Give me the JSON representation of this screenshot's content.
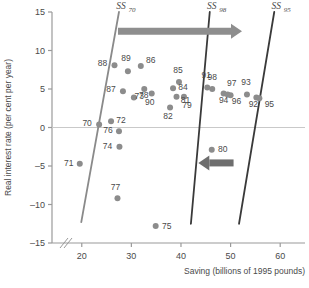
{
  "chart_data": {
    "type": "scatter",
    "title": "",
    "xlabel": "Saving (billions of 1995 pounds)",
    "ylabel": "Real interest rate (per cent per year)",
    "xlim": [
      14,
      65
    ],
    "ylim": [
      -15,
      15
    ],
    "xticks": [
      20,
      30,
      40,
      50,
      60
    ],
    "yticks": [
      15,
      10,
      5,
      0,
      -5,
      -10,
      -15
    ],
    "grid": false,
    "axis_break": true,
    "zero_line": true,
    "legend": "none",
    "points": [
      {
        "label": "88",
        "x": 26.6,
        "y": 8.1
      },
      {
        "label": "89",
        "x": 29.3,
        "y": 7.3
      },
      {
        "label": "86",
        "x": 31.9,
        "y": 8.0
      },
      {
        "label": "87",
        "x": 28.3,
        "y": 4.7
      },
      {
        "label": "78",
        "x": 30.5,
        "y": 3.9
      },
      {
        "label": "73",
        "x": 32.6,
        "y": 5.0
      },
      {
        "label": "90",
        "x": 34.1,
        "y": 4.4
      },
      {
        "label": "85",
        "x": 39.6,
        "y": 5.9
      },
      {
        "label": "84",
        "x": 38.4,
        "y": 5.1
      },
      {
        "label": "79",
        "x": 40.6,
        "y": 4.0
      },
      {
        "label": "81",
        "x": 39.1,
        "y": 4.0
      },
      {
        "label": "82",
        "x": 37.8,
        "y": 2.6
      },
      {
        "label": "91",
        "x": 45.3,
        "y": 5.2
      },
      {
        "label": "98",
        "x": 46.3,
        "y": 5.0
      },
      {
        "label": "97",
        "x": 48.6,
        "y": 4.4
      },
      {
        "label": "94",
        "x": 49.4,
        "y": 4.3
      },
      {
        "label": "96",
        "x": 50.0,
        "y": 4.2
      },
      {
        "label": "93",
        "x": 53.3,
        "y": 4.3
      },
      {
        "label": "92",
        "x": 55.2,
        "y": 3.9
      },
      {
        "label": "95",
        "x": 55.8,
        "y": 3.8
      },
      {
        "label": "72",
        "x": 25.9,
        "y": 0.8
      },
      {
        "label": "70",
        "x": 23.5,
        "y": 0.4
      },
      {
        "label": "76",
        "x": 27.5,
        "y": -0.5
      },
      {
        "label": "74",
        "x": 27.6,
        "y": -2.5
      },
      {
        "label": "71",
        "x": 19.6,
        "y": -4.7
      },
      {
        "label": "80",
        "x": 46.2,
        "y": -2.9
      },
      {
        "label": "77",
        "x": 27.2,
        "y": -9.2
      },
      {
        "label": "75",
        "x": 34.9,
        "y": -12.8
      }
    ],
    "lines": [
      {
        "name": "SS70",
        "base": "SS",
        "subscript": "70",
        "x_top": 27.5,
        "y_top": 15.0,
        "x_bottom": 19.9,
        "y_bottom": -12.3
      },
      {
        "name": "SS98",
        "base": "SS",
        "subscript": "98",
        "x_top": 45.8,
        "y_top": 15.0,
        "x_bottom": 42.0,
        "y_bottom": -12.5
      },
      {
        "name": "SS95",
        "base": "SS",
        "subscript": "95",
        "x_top": 58.8,
        "y_top": 15.0,
        "x_bottom": 51.7,
        "y_bottom": -12.5
      }
    ],
    "arrows": [
      {
        "name": "rightward-shift-arrow",
        "direction": "right",
        "x_start": 27.3,
        "x_end": 52.3,
        "y": 12.5,
        "color": "#8e8e8e"
      },
      {
        "name": "leftward-shift-arrow",
        "direction": "left",
        "x_start": 50.6,
        "x_end": 43.5,
        "y": -4.6,
        "color": "#6e6e6e"
      }
    ],
    "style": {
      "point_color": "#8c8c8c",
      "point_radius": 3.0,
      "ss70_color": "#8a8a8a",
      "ss98_color": "#3a3a3a",
      "ss95_color": "#3a3a3a",
      "axis_color": "#9a9a9a",
      "text_color": "#4a4a4a"
    }
  }
}
